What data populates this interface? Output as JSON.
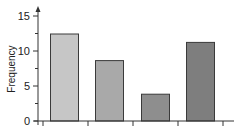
{
  "chart_data": {
    "type": "bar",
    "title": "",
    "xlabel": "",
    "ylabel": "Frequency",
    "categories": [
      "",
      "",
      "",
      ""
    ],
    "values": [
      12.5,
      8.7,
      3.9,
      11.3
    ],
    "bar_colors": [
      "#c6c6c6",
      "#a9a9a9",
      "#8e8e8e",
      "#7e7e7e"
    ],
    "ylim": [
      0,
      15
    ],
    "yticks": [
      0,
      5,
      10,
      15
    ],
    "ytick_labels": [
      "0",
      "5",
      "10",
      "15"
    ],
    "grid": false,
    "legend": null
  },
  "axis": {
    "y_title": "Frequency",
    "y_labels": [
      "0",
      "5",
      "10",
      "15"
    ]
  }
}
